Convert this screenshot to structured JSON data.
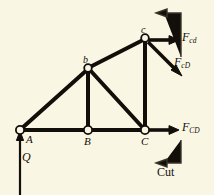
{
  "figure": {
    "type": "truss-free-body-diagram",
    "background_color": "#faf6e4",
    "ink_color": "#120f0a",
    "nodes": [
      {
        "id": "A",
        "label": "A",
        "case": "upper",
        "x": 20,
        "y": 130,
        "marker": "open-circle"
      },
      {
        "id": "B",
        "label": "B",
        "case": "upper",
        "x": 88,
        "y": 130,
        "marker": "open-circle"
      },
      {
        "id": "C",
        "label": "C",
        "case": "upper",
        "x": 145,
        "y": 130,
        "marker": "open-circle"
      },
      {
        "id": "b",
        "label": "b",
        "case": "lower",
        "x": 88,
        "y": 68,
        "marker": "open-circle"
      },
      {
        "id": "c",
        "label": "c",
        "case": "lower",
        "x": 145,
        "y": 38,
        "marker": "open-circle"
      }
    ],
    "members": [
      {
        "from": "A",
        "to": "B",
        "kind": "bottom-chord"
      },
      {
        "from": "B",
        "to": "C",
        "kind": "bottom-chord"
      },
      {
        "from": "A",
        "to": "b",
        "kind": "diagonal"
      },
      {
        "from": "b",
        "to": "c",
        "kind": "top-chord"
      },
      {
        "from": "b",
        "to": "B",
        "kind": "vertical-web"
      },
      {
        "from": "b",
        "to": "C",
        "kind": "diagonal-web"
      },
      {
        "from": "c",
        "to": "C",
        "kind": "vertical-web"
      }
    ],
    "forces": [
      {
        "name": "Q",
        "base": "Q",
        "subscript": "",
        "direction": "up",
        "at_node": "A",
        "label_x": 22,
        "label_y": 158,
        "tail": {
          "x": 20,
          "y": 195
        },
        "head": {
          "x": 20,
          "y": 133
        }
      },
      {
        "name": "F_cd",
        "base": "F",
        "subscript": "cd",
        "direction": "right-horizontal",
        "at_node": "c",
        "label_x": 183,
        "label_y": 34,
        "tail": {
          "x": 147,
          "y": 40
        },
        "head": {
          "x": 178,
          "y": 40
        }
      },
      {
        "name": "F_cD",
        "base": "F",
        "subscript": "cD",
        "direction": "down-right-diagonal",
        "at_node": "c",
        "label_x": 175,
        "label_y": 60,
        "tail": {
          "x": 148,
          "y": 42
        },
        "head": {
          "x": 181,
          "y": 75
        }
      },
      {
        "name": "F_CD",
        "base": "F",
        "subscript": "CD",
        "direction": "right-horizontal",
        "at_node": "C",
        "label_x": 183,
        "label_y": 124,
        "tail": {
          "x": 147,
          "y": 130
        },
        "head": {
          "x": 178,
          "y": 130
        }
      }
    ],
    "cut_indicators": [
      {
        "name": "cut-line-top",
        "label": "",
        "elbow": {
          "vx": 181,
          "vy_from": 55,
          "vy_to": 13,
          "hx_from": 181,
          "hx_to": 158,
          "hy": 13
        },
        "arrow": "left"
      },
      {
        "name": "cut-line-bottom",
        "label": "Cut",
        "label_x": 158,
        "label_y": 172,
        "elbow": {
          "vx": 181,
          "vy_from": 140,
          "vy_to": 163,
          "hx_from": 181,
          "hx_to": 158,
          "hy": 163
        },
        "arrow": "left"
      }
    ]
  }
}
